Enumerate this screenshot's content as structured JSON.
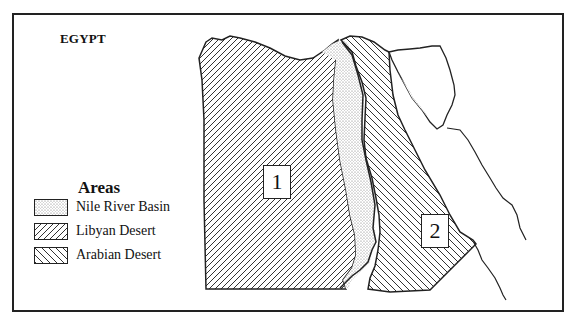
{
  "map": {
    "title": "EGYPT",
    "legend": {
      "title": "Areas",
      "items": [
        {
          "label": "Nile River Basin",
          "pattern": "dots"
        },
        {
          "label": "Libyan Desert",
          "pattern": "diagonal-forward"
        },
        {
          "label": "Arabian Desert",
          "pattern": "diagonal-backward"
        }
      ]
    },
    "region_labels": [
      {
        "id": "1",
        "text": "1",
        "region": "Libyan Desert"
      },
      {
        "id": "2",
        "text": "2",
        "region": "Arabian Desert"
      }
    ],
    "colors": {
      "line": "#222222",
      "background": "#ffffff",
      "dots": "#777777"
    }
  }
}
